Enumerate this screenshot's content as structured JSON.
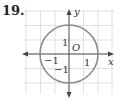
{
  "problem_number": "19.",
  "axes": {
    "x_label": "x",
    "y_label": "y",
    "origin_label": "O"
  },
  "ticks": {
    "x_pos": "1",
    "x_neg": "−1",
    "y_pos": "1",
    "y_neg": "−1"
  },
  "shape": {
    "type": "circle",
    "center": [
      0,
      0
    ],
    "radius": 2,
    "equation_hint": "x^2 + y^2 = 4"
  },
  "colors": {
    "circle": "#8a8a8a",
    "grid": "#d9d9d9",
    "axis": "#444444"
  }
}
